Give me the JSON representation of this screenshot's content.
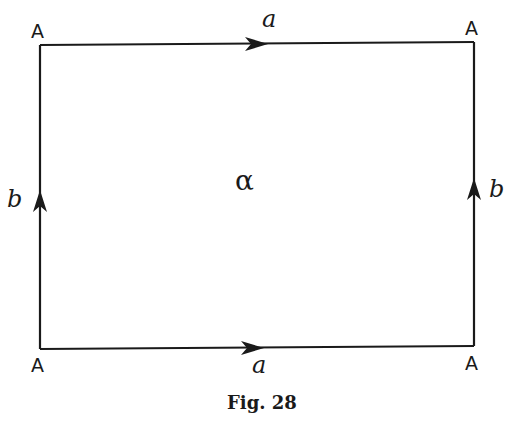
{
  "figure": {
    "caption": "Fig. 28",
    "face_label": "α",
    "vertices": [
      {
        "id": "top-left",
        "label": "A"
      },
      {
        "id": "top-right",
        "label": "A"
      },
      {
        "id": "bottom-left",
        "label": "A"
      },
      {
        "id": "bottom-right",
        "label": "A"
      }
    ],
    "edges": [
      {
        "id": "top",
        "label": "a",
        "direction": "right"
      },
      {
        "id": "bottom",
        "label": "a",
        "direction": "right"
      },
      {
        "id": "left",
        "label": "b",
        "direction": "up"
      },
      {
        "id": "right",
        "label": "b",
        "direction": "up"
      }
    ],
    "colors": {
      "ink": "#1a1a1a",
      "background": "#ffffff"
    }
  }
}
